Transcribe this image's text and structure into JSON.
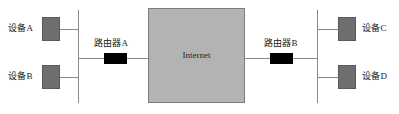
{
  "diagram": {
    "type": "network-topology",
    "colors": {
      "background": "#ffffff",
      "device_fill": "#6e6e6e",
      "device_border": "#5a5a5a",
      "router_fill": "#000000",
      "internet_fill": "#b3b3b3",
      "internet_border": "#7d7d7d",
      "line": "#8a8a8a",
      "text": "#1a1a1a"
    },
    "nodes": {
      "device_a": {
        "label": "设备A",
        "kind": "device"
      },
      "device_b": {
        "label": "设备B",
        "kind": "device"
      },
      "device_c": {
        "label": "设备C",
        "kind": "device"
      },
      "device_d": {
        "label": "设备D",
        "kind": "device"
      },
      "router_a": {
        "label": "路由器A",
        "kind": "router"
      },
      "router_b": {
        "label": "路由器B",
        "kind": "router"
      },
      "internet": {
        "label": "Internet",
        "kind": "cloud"
      }
    }
  }
}
